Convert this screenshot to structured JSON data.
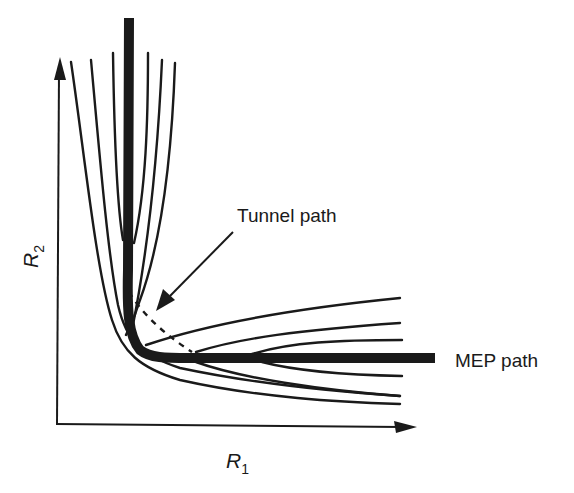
{
  "diagram": {
    "type": "potential-energy-surface-contour",
    "colors": {
      "background": "#ffffff",
      "ink": "#1a1a1a"
    },
    "axes": {
      "x_label": "R",
      "x_subscript": "1",
      "y_label": "R",
      "y_subscript": "2"
    },
    "labels": {
      "tunnel_path": "Tunnel path",
      "mep_path": "MEP path"
    },
    "paths": [
      {
        "name": "MEP path",
        "style": "thick-solid",
        "description": "Minimum energy path along valley floor, vertical then horizontal"
      },
      {
        "name": "Tunnel path",
        "style": "dashed",
        "description": "Corner-cutting tunneling path"
      }
    ],
    "contours": {
      "vertical_branch_count": 6,
      "horizontal_branch_count": 6
    }
  }
}
